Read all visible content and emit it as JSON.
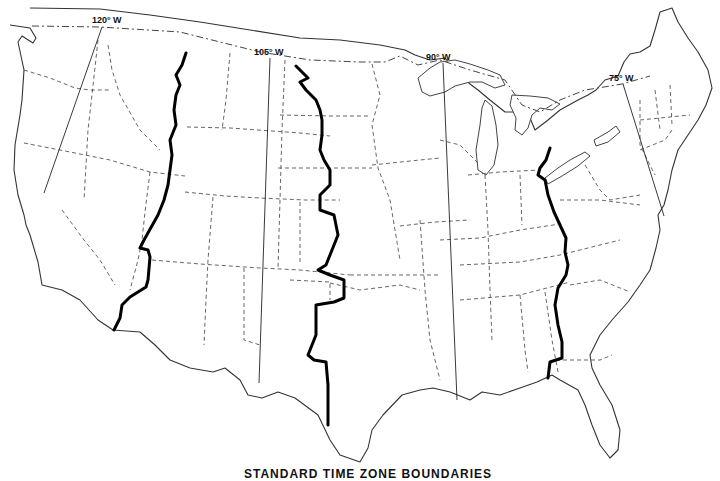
{
  "map": {
    "title": "STANDARD TIME ZONE BOUNDARIES",
    "region": "Contiguous United States",
    "style": "black-and-white line map",
    "colors": {
      "background": "#ffffff",
      "boundary": "#000000",
      "lines": "#333333"
    },
    "meridians": [
      {
        "label": "120° W",
        "x1": 102,
        "y1": 27,
        "x2": 44,
        "y2": 193
      },
      {
        "label": "105° W",
        "x1": 270,
        "y1": 58,
        "x2": 259,
        "y2": 383
      },
      {
        "label": "90° W",
        "x1": 443,
        "y1": 63,
        "x2": 457,
        "y2": 400
      },
      {
        "label": "75° W",
        "x1": 623,
        "y1": 84,
        "x2": 664,
        "y2": 216
      }
    ],
    "time_zone_boundaries": [
      {
        "name": "Pacific-Mountain boundary"
      },
      {
        "name": "Mountain-Central boundary"
      },
      {
        "name": "Central-Eastern boundary"
      }
    ]
  }
}
